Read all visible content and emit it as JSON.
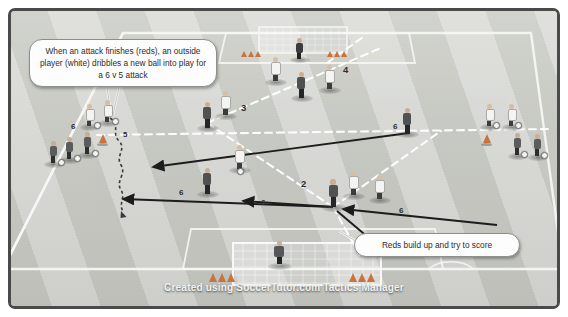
{
  "diagram": {
    "watermark": "Created using SoccerTutor.com Tactics Manager",
    "field_color": "#c9cbc4",
    "stripe_color": "#d7d8d3",
    "line_color": "#f6f6f4",
    "border_color": "#4a4a4a"
  },
  "callouts": [
    {
      "id": "callout-dribble",
      "text": "When an attack finishes (reds), an outside player (white) dribbles a new ball into play for a 6 v 5 attack"
    },
    {
      "id": "callout-score",
      "text": "Reds build up and try to score"
    }
  ],
  "labels": [
    {
      "id": "label-5-dribble",
      "text": "5"
    },
    {
      "id": "label-3-pass",
      "text": "3"
    },
    {
      "id": "label-4-pass",
      "text": "4"
    },
    {
      "id": "label-2-hub",
      "text": "2"
    },
    {
      "id": "label-6-left-a",
      "text": "6"
    },
    {
      "id": "label-6-left-b",
      "text": "6"
    },
    {
      "id": "label-6-center",
      "text": "6"
    },
    {
      "id": "label-6-right",
      "text": "6"
    },
    {
      "id": "label-6-upper",
      "text": "6"
    }
  ],
  "teams": {
    "reds": {
      "name": "Reds",
      "shirt": "#5a5c5e",
      "role": "attacking team"
    },
    "whites": {
      "name": "Whites",
      "shirt": "#f4f4f2",
      "role": "defending / serving team"
    }
  },
  "arrows": {
    "run_color": "#1c1c1c",
    "pass_color": "#ffffff",
    "dribble_style": "wavy"
  },
  "equipment": {
    "cone_color": "#c9733f",
    "ball_color": "#f4f4f2",
    "goal_count": 2
  }
}
